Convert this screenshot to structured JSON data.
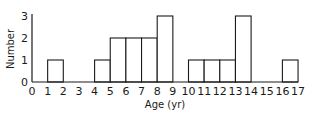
{
  "chart_data": {
    "type": "bar",
    "title": "",
    "xlabel": "Age (yr)",
    "ylabel": "Number",
    "ylim": [
      0,
      3
    ],
    "xlim": [
      0,
      17
    ],
    "grid": false,
    "legend": null,
    "x_ticks": [
      "0",
      "1",
      "2",
      "3",
      "4",
      "5",
      "6",
      "7",
      "8",
      "9",
      "10",
      "11",
      "12",
      "13",
      "14",
      "15",
      "16",
      "17"
    ],
    "y_ticks": [
      "0",
      "1",
      "2",
      "3"
    ],
    "bins": [
      {
        "start": 1,
        "end": 2,
        "value": 1
      },
      {
        "start": 4,
        "end": 5,
        "value": 1
      },
      {
        "start": 5,
        "end": 6,
        "value": 2
      },
      {
        "start": 6,
        "end": 7,
        "value": 2
      },
      {
        "start": 7,
        "end": 8,
        "value": 2
      },
      {
        "start": 8,
        "end": 9,
        "value": 3
      },
      {
        "start": 10,
        "end": 11,
        "value": 1
      },
      {
        "start": 11,
        "end": 12,
        "value": 1
      },
      {
        "start": 12,
        "end": 13,
        "value": 1
      },
      {
        "start": 13,
        "end": 14,
        "value": 3
      },
      {
        "start": 16,
        "end": 17,
        "value": 1
      }
    ],
    "categories": [
      "0-1",
      "1-2",
      "2-3",
      "3-4",
      "4-5",
      "5-6",
      "6-7",
      "7-8",
      "8-9",
      "9-10",
      "10-11",
      "11-12",
      "12-13",
      "13-14",
      "14-15",
      "15-16",
      "16-17"
    ],
    "values": [
      0,
      1,
      0,
      0,
      1,
      2,
      2,
      2,
      3,
      0,
      1,
      1,
      1,
      3,
      0,
      0,
      1
    ]
  }
}
